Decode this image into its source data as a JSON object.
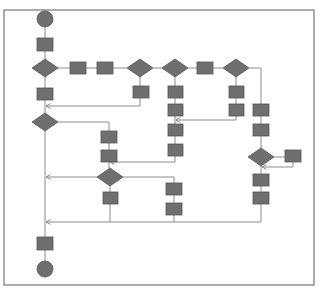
{
  "diagram": {
    "type": "flowchart",
    "colors": {
      "node_fill": "#6f6f6f",
      "node_stroke": "#555555",
      "edge": "#8c8c8c",
      "frame": "#8a8a8a",
      "background": "#ffffff"
    },
    "frame": {
      "x": 4,
      "y": 10,
      "w": 310,
      "h": 275
    },
    "nodes": [
      {
        "id": "start",
        "shape": "circle",
        "cx": 45,
        "cy": 19,
        "r": 8,
        "label": ""
      },
      {
        "id": "r1",
        "shape": "rect",
        "x": 37,
        "y": 38,
        "w": 16,
        "h": 13,
        "label": ""
      },
      {
        "id": "d1",
        "shape": "diamond",
        "cx": 45,
        "cy": 68,
        "w": 26,
        "h": 18,
        "label": ""
      },
      {
        "id": "ra",
        "shape": "rect",
        "x": 70,
        "y": 62,
        "w": 16,
        "h": 12,
        "label": ""
      },
      {
        "id": "rb",
        "shape": "rect",
        "x": 97,
        "y": 62,
        "w": 16,
        "h": 12,
        "label": ""
      },
      {
        "id": "d2",
        "shape": "diamond",
        "cx": 140,
        "cy": 68,
        "w": 26,
        "h": 18,
        "label": ""
      },
      {
        "id": "r2",
        "shape": "rect",
        "x": 133,
        "y": 86,
        "w": 16,
        "h": 12,
        "label": ""
      },
      {
        "id": "d3",
        "shape": "diamond",
        "cx": 175,
        "cy": 68,
        "w": 26,
        "h": 18,
        "label": ""
      },
      {
        "id": "r3a",
        "shape": "rect",
        "x": 168,
        "y": 86,
        "w": 15,
        "h": 12,
        "label": ""
      },
      {
        "id": "r3b",
        "shape": "rect",
        "x": 168,
        "y": 104,
        "w": 15,
        "h": 12,
        "label": ""
      },
      {
        "id": "r3c",
        "shape": "rect",
        "x": 168,
        "y": 124,
        "w": 15,
        "h": 12,
        "label": ""
      },
      {
        "id": "r3d",
        "shape": "rect",
        "x": 168,
        "y": 144,
        "w": 15,
        "h": 12,
        "label": ""
      },
      {
        "id": "rc",
        "shape": "rect",
        "x": 197,
        "y": 62,
        "w": 16,
        "h": 12,
        "label": ""
      },
      {
        "id": "d4",
        "shape": "diamond",
        "cx": 236,
        "cy": 68,
        "w": 26,
        "h": 18,
        "label": ""
      },
      {
        "id": "r4a",
        "shape": "rect",
        "x": 229,
        "y": 86,
        "w": 15,
        "h": 12,
        "label": ""
      },
      {
        "id": "r4b",
        "shape": "rect",
        "x": 229,
        "y": 104,
        "w": 15,
        "h": 12,
        "label": ""
      },
      {
        "id": "r5a",
        "shape": "rect",
        "x": 253,
        "y": 104,
        "w": 16,
        "h": 12,
        "label": ""
      },
      {
        "id": "r5b",
        "shape": "rect",
        "x": 253,
        "y": 124,
        "w": 16,
        "h": 12,
        "label": ""
      },
      {
        "id": "d5",
        "shape": "diamond",
        "cx": 261,
        "cy": 157,
        "w": 26,
        "h": 18,
        "label": ""
      },
      {
        "id": "r5side",
        "shape": "rect",
        "x": 285,
        "y": 150,
        "w": 16,
        "h": 12,
        "label": ""
      },
      {
        "id": "r5c",
        "shape": "rect",
        "x": 253,
        "y": 174,
        "w": 16,
        "h": 12,
        "label": ""
      },
      {
        "id": "r5d",
        "shape": "rect",
        "x": 253,
        "y": 192,
        "w": 16,
        "h": 12,
        "label": ""
      },
      {
        "id": "r1b",
        "shape": "rect",
        "x": 37,
        "y": 88,
        "w": 16,
        "h": 12,
        "label": ""
      },
      {
        "id": "d6",
        "shape": "diamond",
        "cx": 45,
        "cy": 122,
        "w": 26,
        "h": 18,
        "label": ""
      },
      {
        "id": "r6a",
        "shape": "rect",
        "x": 101,
        "y": 131,
        "w": 16,
        "h": 12,
        "label": ""
      },
      {
        "id": "r6b",
        "shape": "rect",
        "x": 101,
        "y": 150,
        "w": 16,
        "h": 12,
        "label": ""
      },
      {
        "id": "d7",
        "shape": "diamond",
        "cx": 110,
        "cy": 177,
        "w": 26,
        "h": 18,
        "label": ""
      },
      {
        "id": "r7",
        "shape": "rect",
        "x": 103,
        "y": 192,
        "w": 15,
        "h": 12,
        "label": ""
      },
      {
        "id": "r8a",
        "shape": "rect",
        "x": 166,
        "y": 183,
        "w": 16,
        "h": 12,
        "label": ""
      },
      {
        "id": "r8b",
        "shape": "rect",
        "x": 166,
        "y": 203,
        "w": 16,
        "h": 12,
        "label": ""
      },
      {
        "id": "r9",
        "shape": "rect",
        "x": 37,
        "y": 237,
        "w": 16,
        "h": 13,
        "label": ""
      },
      {
        "id": "end",
        "shape": "circle",
        "cx": 45,
        "cy": 269,
        "r": 8,
        "label": ""
      }
    ],
    "edges": [
      {
        "points": [
          [
            45,
            27
          ],
          [
            45,
            38
          ]
        ]
      },
      {
        "points": [
          [
            45,
            51
          ],
          [
            45,
            59
          ]
        ]
      },
      {
        "points": [
          [
            58,
            68
          ],
          [
            70,
            68
          ]
        ]
      },
      {
        "points": [
          [
            86,
            68
          ],
          [
            97,
            68
          ]
        ]
      },
      {
        "points": [
          [
            113,
            68
          ],
          [
            127,
            68
          ]
        ]
      },
      {
        "points": [
          [
            153,
            68
          ],
          [
            162,
            68
          ]
        ]
      },
      {
        "points": [
          [
            188,
            68
          ],
          [
            197,
            68
          ]
        ]
      },
      {
        "points": [
          [
            213,
            68
          ],
          [
            223,
            68
          ]
        ]
      },
      {
        "points": [
          [
            249,
            68
          ],
          [
            261,
            68
          ],
          [
            261,
            104
          ]
        ]
      },
      {
        "points": [
          [
            140,
            77
          ],
          [
            140,
            86
          ]
        ]
      },
      {
        "points": [
          [
            140,
            98
          ],
          [
            140,
            106
          ],
          [
            46,
            106
          ]
        ],
        "arrow": true
      },
      {
        "points": [
          [
            45,
            77
          ],
          [
            45,
            88
          ]
        ]
      },
      {
        "points": [
          [
            45,
            100
          ],
          [
            45,
            113
          ]
        ]
      },
      {
        "points": [
          [
            175,
            77
          ],
          [
            175,
            86
          ]
        ]
      },
      {
        "points": [
          [
            175,
            98
          ],
          [
            175,
            104
          ]
        ]
      },
      {
        "points": [
          [
            175,
            116
          ],
          [
            175,
            124
          ]
        ]
      },
      {
        "points": [
          [
            175,
            136
          ],
          [
            175,
            144
          ]
        ]
      },
      {
        "points": [
          [
            236,
            77
          ],
          [
            236,
            86
          ]
        ]
      },
      {
        "points": [
          [
            236,
            98
          ],
          [
            236,
            104
          ]
        ]
      },
      {
        "points": [
          [
            236,
            116
          ],
          [
            236,
            120
          ],
          [
            176,
            120
          ]
        ],
        "arrow": true
      },
      {
        "points": [
          [
            58,
            122
          ],
          [
            109,
            122
          ],
          [
            109,
            131
          ]
        ]
      },
      {
        "points": [
          [
            109,
            143
          ],
          [
            109,
            150
          ]
        ]
      },
      {
        "points": [
          [
            109,
            162
          ],
          [
            109,
            168
          ]
        ]
      },
      {
        "points": [
          [
            175,
            156
          ],
          [
            175,
            162
          ],
          [
            110,
            162
          ]
        ],
        "arrow": true
      },
      {
        "points": [
          [
            261,
            116
          ],
          [
            261,
            124
          ]
        ]
      },
      {
        "points": [
          [
            261,
            136
          ],
          [
            261,
            148
          ]
        ]
      },
      {
        "points": [
          [
            274,
            157
          ],
          [
            285,
            157
          ]
        ]
      },
      {
        "points": [
          [
            293,
            162
          ],
          [
            293,
            167
          ],
          [
            262,
            167
          ]
        ],
        "arrow": true
      },
      {
        "points": [
          [
            261,
            166
          ],
          [
            261,
            174
          ]
        ]
      },
      {
        "points": [
          [
            261,
            186
          ],
          [
            261,
            192
          ]
        ]
      },
      {
        "points": [
          [
            97,
            177
          ],
          [
            46,
            177
          ]
        ],
        "arrow": true
      },
      {
        "points": [
          [
            123,
            177
          ],
          [
            174,
            177
          ],
          [
            174,
            183
          ]
        ]
      },
      {
        "points": [
          [
            174,
            195
          ],
          [
            174,
            203
          ]
        ]
      },
      {
        "points": [
          [
            110,
            186
          ],
          [
            110,
            192
          ]
        ]
      },
      {
        "points": [
          [
            110,
            204
          ],
          [
            110,
            222
          ],
          [
            46,
            222
          ]
        ],
        "arrow": true
      },
      {
        "points": [
          [
            174,
            215
          ],
          [
            174,
            222
          ]
        ]
      },
      {
        "points": [
          [
            261,
            204
          ],
          [
            261,
            222
          ],
          [
            110,
            222
          ]
        ]
      },
      {
        "points": [
          [
            45,
            131
          ],
          [
            45,
            237
          ]
        ]
      },
      {
        "points": [
          [
            45,
            250
          ],
          [
            45,
            261
          ]
        ]
      }
    ]
  }
}
